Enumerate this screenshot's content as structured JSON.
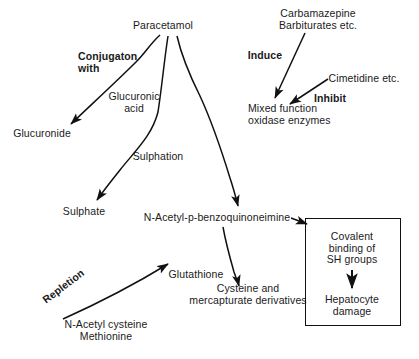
{
  "diagram": {
    "type": "flow-diagram",
    "background_color": "#ffffff",
    "stroke_color": "#111111",
    "text_color": "#1a1a1a",
    "nodes": [
      {
        "id": "paracetamol",
        "label": "Paracetamol",
        "x": 163,
        "y": 26,
        "style": "plain"
      },
      {
        "id": "glucuronide",
        "label": "Glucuronide",
        "x": 42,
        "y": 134,
        "style": "plain"
      },
      {
        "id": "sulphate",
        "label": "Sulphate",
        "x": 84,
        "y": 212,
        "style": "plain"
      },
      {
        "id": "mfo",
        "label": "Mixed function\noxidase enzymes",
        "x": 248,
        "y": 114,
        "style": "plain"
      },
      {
        "id": "napqi",
        "label": "N-Acetyl-p-benzoquinoneimine",
        "x": 217,
        "y": 218,
        "style": "plain"
      },
      {
        "id": "carbamazepine",
        "label": "Carbamazepine\nBarbiturates etc.",
        "x": 318,
        "y": 19,
        "style": "plain"
      },
      {
        "id": "cimetidine",
        "label": "Cimetidine etc.",
        "x": 364,
        "y": 79,
        "style": "plain"
      },
      {
        "id": "cysteine",
        "label": "Cysteine and\nmercapturate derivatives",
        "x": 248,
        "y": 294,
        "style": "plain"
      },
      {
        "id": "nac",
        "label": "N-Acetyl cysteine\nMethionine",
        "x": 106,
        "y": 330,
        "style": "plain"
      },
      {
        "id": "covalent",
        "label": "Covalent\nbinding of\nSH groups",
        "x": 352,
        "y": 248,
        "style": "in-box"
      },
      {
        "id": "hepatocyte",
        "label": "Hepatocyte\ndamage",
        "x": 352,
        "y": 305,
        "style": "in-box"
      }
    ],
    "edge_labels": [
      {
        "id": "conjugation",
        "label": "Conjugaton\nwith",
        "bold": true,
        "rotated": false,
        "x": 78,
        "y": 62
      },
      {
        "id": "glucuronic",
        "label": "Glucuronic\nacid",
        "bold": false,
        "rotated": false,
        "x": 134,
        "y": 102
      },
      {
        "id": "sulphation",
        "label": "Sulphation",
        "bold": false,
        "rotated": false,
        "x": 158,
        "y": 157
      },
      {
        "id": "induce",
        "label": "Induce",
        "bold": true,
        "rotated": false,
        "x": 265,
        "y": 56
      },
      {
        "id": "inhibit",
        "label": "Inhibit",
        "bold": true,
        "rotated": false,
        "x": 330,
        "y": 99
      },
      {
        "id": "glutathione",
        "label": "Glutathione",
        "bold": false,
        "rotated": false,
        "x": 196,
        "y": 275
      },
      {
        "id": "repletion",
        "label": "Repletion",
        "bold": true,
        "rotated": true,
        "x": 72,
        "y": 300,
        "angle": -37
      }
    ],
    "box": {
      "id": "toxicity-box",
      "x": 305,
      "y": 218,
      "width": 96,
      "height": 108
    },
    "arrows": [
      {
        "id": "paracetamol-to-glucuronide",
        "from": "paracetamol",
        "to": "glucuronide"
      },
      {
        "id": "paracetamol-to-sulphate",
        "from": "paracetamol",
        "to": "sulphate"
      },
      {
        "id": "paracetamol-to-mfo",
        "from": "paracetamol",
        "to": "napqi"
      },
      {
        "id": "carbamazepine-to-mfo",
        "from": "carbamazepine",
        "to": "mfo"
      },
      {
        "id": "cimetidine-to-mfo",
        "from": "cimetidine",
        "to": "mfo"
      },
      {
        "id": "napqi-to-cysteine",
        "from": "napqi",
        "to": "cysteine"
      },
      {
        "id": "nac-to-glutathione",
        "from": "nac",
        "to": "glutathione"
      },
      {
        "id": "napqi-to-box",
        "from": "napqi",
        "to": "toxicity-box"
      },
      {
        "id": "covalent-to-hepatocyte",
        "from": "covalent",
        "to": "hepatocyte"
      }
    ]
  }
}
